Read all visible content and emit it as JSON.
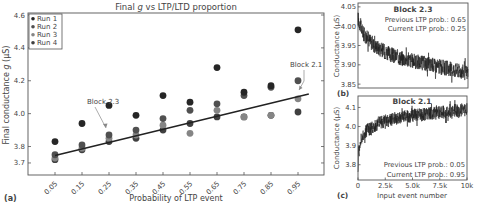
{
  "chart_data": [
    {
      "id": "a",
      "panel_label": "(a)",
      "type": "scatter",
      "title": "Final g vs LTP/LTD proportion",
      "title_parts": {
        "pre": "Final ",
        "italic": "g",
        "post": " vs LTP/LTD proportion"
      },
      "xlabel": "Probability of LTP event",
      "ylabel": "Final conductance g (μS)",
      "ylabel_parts": {
        "pre": "Final conductance ",
        "italic": "g",
        "post": " (μS)"
      },
      "categories": [
        "0.05",
        "0.15",
        "0.25",
        "0.35",
        "0.45",
        "0.55",
        "0.65",
        "0.75",
        "0.85",
        "0.95"
      ],
      "x": [
        0.05,
        0.15,
        0.25,
        0.35,
        0.45,
        0.55,
        0.65,
        0.75,
        0.85,
        0.95
      ],
      "ylim": [
        3.67,
        4.6
      ],
      "yticks": [
        3.7,
        3.8,
        4.0,
        4.2,
        4.4,
        4.6
      ],
      "ytick_labels": [
        "3.7",
        "3.8",
        "4.0",
        "4.2",
        "4.4",
        "4.6"
      ],
      "grid": false,
      "legend_position": "upper left",
      "series": [
        {
          "name": "Run 1",
          "color": "#262626",
          "values": [
            3.83,
            3.94,
            4.05,
            3.99,
            4.11,
            4.07,
            4.28,
            4.13,
            4.17,
            4.51
          ]
        },
        {
          "name": "Run 2",
          "color": "#505050",
          "values": [
            3.75,
            3.81,
            3.87,
            3.9,
            3.97,
            4.02,
            4.06,
            4.11,
            4.16,
            4.2
          ]
        },
        {
          "name": "Run 3",
          "color": "#858585",
          "values": [
            3.73,
            3.79,
            3.85,
            3.87,
            3.93,
            3.88,
            4.02,
            3.98,
            3.99,
            4.09
          ]
        },
        {
          "name": "Run 4",
          "color": "#404040",
          "values": [
            3.72,
            3.78,
            3.83,
            3.85,
            3.9,
            3.94,
            3.98,
            3.98,
            3.99,
            4.01
          ]
        }
      ],
      "fit_line": {
        "x": [
          0.05,
          0.99
        ],
        "y": [
          3.745,
          4.12
        ],
        "color": "#222222"
      },
      "annotations": [
        {
          "text": "Block 2.3",
          "x": 0.25,
          "y": 3.87
        },
        {
          "text": "Block 2.1",
          "x": 0.95,
          "y": 4.09
        }
      ]
    },
    {
      "id": "b",
      "panel_label": "(b)",
      "type": "line",
      "title": "Block 2.3",
      "xlabel": "",
      "ylabel": "Conductance (μS)",
      "xlim": [
        0,
        10000
      ],
      "ylim": [
        3.84,
        4.06
      ],
      "yticks": [
        3.85,
        3.9,
        3.95,
        4.0,
        4.05
      ],
      "ytick_labels": [
        "3.85",
        "3.90",
        "3.95",
        "4.00",
        "4.05"
      ],
      "annotations": [
        "Previous LTP prob.: 0.65",
        "Current LTP prob.: 0.25"
      ],
      "trend": {
        "x": [
          0,
          500,
          1500,
          3000,
          5000,
          7500,
          10000
        ],
        "y": [
          4.02,
          3.98,
          3.95,
          3.925,
          3.91,
          3.895,
          3.88
        ]
      },
      "noise_amplitude": 0.02
    },
    {
      "id": "c",
      "panel_label": "(c)",
      "type": "line",
      "title": "Block 2.1",
      "xlabel": "Input event number",
      "ylabel": "Conductance (μS)",
      "xlim": [
        0,
        10000
      ],
      "xticks": [
        0,
        2500,
        5000,
        7500,
        10000
      ],
      "xtick_labels": [
        "0",
        "2.5k",
        "5.0k",
        "7.5k",
        "10k"
      ],
      "ylim": [
        3.72,
        4.16
      ],
      "yticks": [
        3.8,
        3.9,
        4.0,
        4.1
      ],
      "ytick_labels": [
        "3.8",
        "3.9",
        "4.0",
        "4.1"
      ],
      "annotations": [
        "Previous LTP prob.: 0.05",
        "Current LTP prob.: 0.95"
      ],
      "trend": {
        "x": [
          0,
          200,
          800,
          2000,
          4000,
          7000,
          10000
        ],
        "y": [
          3.82,
          3.92,
          3.98,
          4.02,
          4.05,
          4.07,
          4.09
        ]
      },
      "noise_amplitude": 0.035
    }
  ]
}
